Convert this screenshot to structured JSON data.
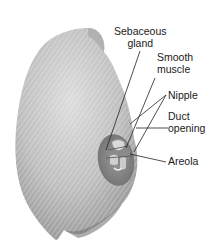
{
  "figure": {
    "labels": {
      "sebaceous_gland": {
        "line1": "Sebaceous",
        "line2": "gland"
      },
      "smooth_muscle": {
        "line1": "Smooth",
        "line2": "muscle"
      },
      "nipple": {
        "line1": "Nipple"
      },
      "duct_opening": {
        "line1": "Duct",
        "line2": "opening"
      },
      "areola": {
        "line1": "Areola"
      }
    },
    "colors": {
      "skin_light": "#d9d9d9",
      "skin_mid": "#b8b8b8",
      "skin_dark": "#8a8a8a",
      "areola": "#7d7d7d",
      "nipple_detail": "#e8e8e8",
      "leader_line": "#222222",
      "text": "#1a1a1a"
    }
  }
}
